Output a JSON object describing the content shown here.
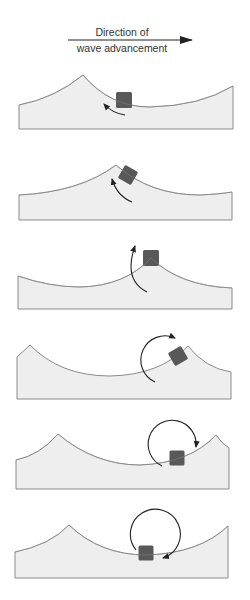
{
  "header": {
    "line1": "Direction of",
    "line2": "wave advancement",
    "arrow": {
      "x1": 68,
      "x2": 192,
      "y": 40
    }
  },
  "colors": {
    "water_fill": "#eeeeee",
    "water_stroke": "#8a8a8a",
    "particle": "#585858",
    "arrow": "#222222",
    "text": "#333333"
  },
  "panels": [
    {
      "name": "panel-1",
      "wave_path": "M19,105 Q55,98 83,75 Q110,107 150,107 Q200,106 233,86 L233,129 L19,129 Z",
      "particle": {
        "cx": 124,
        "cy": 100,
        "size": 16,
        "rotate": 0
      },
      "arrow_path": "M125,115 Q112,113 104,104",
      "arrow_type": "short-curve"
    },
    {
      "name": "panel-2",
      "wave_path": "M19,195 Q80,192 116,165 Q150,195 200,195 Q220,194 232,192 L232,220 L19,220 Z",
      "particle": {
        "cx": 128,
        "cy": 175,
        "size": 15,
        "rotate": 30
      },
      "arrow_path": "M132,202 Q117,196 112,179",
      "arrow_type": "short-curve"
    },
    {
      "name": "panel-3",
      "wave_path": "M18,276 Q50,287 80,287 Q125,286 151,258 Q180,286 232,288 L232,309 L18,309 Z",
      "particle": {
        "cx": 151,
        "cy": 258,
        "size": 16,
        "rotate": 0
      },
      "arrow_path": "M147,292 Q123,280 135,246",
      "arrow_type": "half-circle"
    },
    {
      "name": "panel-4",
      "wave_path": "M17,357 L30,345 Q60,376 110,376 Q160,375 188,346 Q205,368 231,372 L231,399 L17,399 Z",
      "particle": {
        "cx": 178,
        "cy": 356,
        "size": 15,
        "rotate": -30
      },
      "arrow_path": "M155,382 A22,22 0 1 1 175,338",
      "arrow_type": "three-quarter-circle"
    },
    {
      "name": "panel-5",
      "wave_path": "M16,460 Q40,455 58,434 Q95,465 140,465 Q190,463 216,435 Q222,444 229,448 L229,489 L16,489 Z",
      "particle": {
        "cx": 177,
        "cy": 458,
        "size": 15,
        "rotate": 0
      },
      "arrow_path": "M162,466 A24,24 0 1 1 196,447",
      "arrow_type": "near-full-circle"
    },
    {
      "name": "panel-6",
      "wave_path": "M15,552 Q50,545 69,525 Q100,555 147,555 Q200,553 228,526 L228,578 L15,578 Z",
      "particle": {
        "cx": 146,
        "cy": 553,
        "size": 15,
        "rotate": 0
      },
      "arrow_path": "M136,550 A25,25 0 1 1 163,558",
      "arrow_type": "full-circle"
    }
  ]
}
